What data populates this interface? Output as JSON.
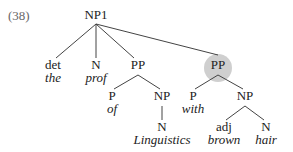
{
  "example_number": "(38)",
  "highlight_color": "#cfcfcf",
  "nodes": {
    "root": "NP1",
    "det": {
      "cat": "det",
      "word": "the"
    },
    "n1": {
      "cat": "N",
      "word": "prof"
    },
    "pp1": "PP",
    "p1": {
      "cat": "P",
      "word": "of"
    },
    "np1": "NP",
    "n2": {
      "cat": "N",
      "word": "Linguistics"
    },
    "pp2": "PP",
    "p2": {
      "cat": "P",
      "word": "with"
    },
    "np2": "NP",
    "adj": {
      "cat": "adj",
      "word": "brown"
    },
    "n3": {
      "cat": "N",
      "word": "hair"
    }
  }
}
